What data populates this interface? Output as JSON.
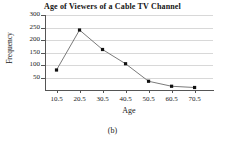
{
  "chart_data": {
    "type": "line",
    "title": "Age of Viewers of a Cable TV Channel",
    "xlabel": "Age",
    "ylabel": "Frequency",
    "x": [
      10.5,
      20.5,
      30.5,
      40.5,
      50.5,
      60.5,
      70.5
    ],
    "categories": [
      "10.5",
      "20.5",
      "30.5",
      "40.5",
      "50.5",
      "60.5",
      "70.5"
    ],
    "values": [
      80,
      240,
      162,
      105,
      35,
      15,
      10
    ],
    "series": [
      {
        "name": "Frequency",
        "values": [
          80,
          240,
          162,
          105,
          35,
          15,
          10
        ]
      }
    ],
    "xlim": [
      5.5,
      78.5
    ],
    "ylim": [
      0,
      300
    ],
    "ytick_labels": [
      "300",
      "250",
      "200",
      "150",
      "100",
      "50"
    ],
    "yticks": [
      300,
      250,
      200,
      150,
      100,
      50
    ],
    "xtick_labels": [
      "10.5",
      "20.5",
      "30.5",
      "40.5",
      "50.5",
      "60.5",
      "70.5"
    ],
    "grid": true,
    "grid_axis": "y",
    "legend": false,
    "legend_position": "none",
    "marker": "filled-square",
    "marker_color": "#111111",
    "line_color": "#6b6b6b",
    "grid_color": "#d8d8d8",
    "axis_color": "#555555"
  },
  "caption": {
    "label": "(b)"
  }
}
